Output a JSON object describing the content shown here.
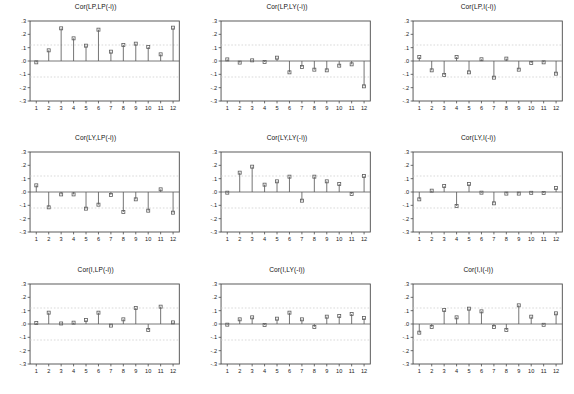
{
  "figure": {
    "name": "cross-correlogram-matrix",
    "rows": 3,
    "cols": 3
  },
  "chart_data": [
    {
      "type": "bar",
      "title": "Cor(LP,LP(-i))",
      "xlabel": "",
      "ylabel": "",
      "categories": [
        1,
        2,
        3,
        4,
        5,
        6,
        7,
        8,
        9,
        10,
        11,
        12
      ],
      "values": [
        -0.01,
        0.08,
        0.245,
        0.17,
        0.115,
        0.235,
        0.07,
        0.12,
        0.13,
        0.105,
        0.05,
        0.25
      ],
      "ylim": [
        -0.3,
        0.3
      ],
      "yticks": [
        ".3",
        ".2",
        ".1",
        ".0",
        "-.1",
        "-.2",
        "-.3"
      ],
      "xticks": [
        "1",
        "2",
        "3",
        "4",
        "5",
        "6",
        "7",
        "8",
        "9",
        "10",
        "11",
        "12"
      ],
      "confidence_band": 0.12,
      "grid": false,
      "legend": "none"
    },
    {
      "type": "bar",
      "title": "Cor(LP,LY(-i))",
      "xlabel": "",
      "ylabel": "",
      "categories": [
        1,
        2,
        3,
        4,
        5,
        6,
        7,
        8,
        9,
        10,
        11,
        12
      ],
      "values": [
        0.012,
        -0.012,
        0.005,
        -0.007,
        0.025,
        -0.085,
        -0.045,
        -0.065,
        -0.07,
        -0.035,
        -0.025,
        -0.19
      ],
      "ylim": [
        -0.3,
        0.3
      ],
      "yticks": [
        ".3",
        ".2",
        ".1",
        ".0",
        "-.1",
        "-.2",
        "-.3"
      ],
      "xticks": [
        "1",
        "2",
        "3",
        "4",
        "5",
        "6",
        "7",
        "8",
        "9",
        "10",
        "11",
        "12"
      ],
      "confidence_band": 0.12,
      "grid": false,
      "legend": "none"
    },
    {
      "type": "bar",
      "title": "Cor(LP,I(-i))",
      "xlabel": "",
      "ylabel": "",
      "categories": [
        1,
        2,
        3,
        4,
        5,
        6,
        7,
        8,
        9,
        10,
        11,
        12
      ],
      "values": [
        0.03,
        -0.07,
        -0.105,
        0.03,
        -0.085,
        0.013,
        -0.125,
        0.018,
        -0.065,
        -0.015,
        -0.01,
        -0.095
      ],
      "ylim": [
        -0.3,
        0.3
      ],
      "yticks": [
        ".3",
        ".2",
        ".1",
        ".0",
        "-.1",
        "-.2",
        "-.3"
      ],
      "xticks": [
        "1",
        "2",
        "3",
        "4",
        "5",
        "6",
        "7",
        "8",
        "9",
        "10",
        "11",
        "12"
      ],
      "confidence_band": 0.12,
      "grid": false,
      "legend": "none"
    },
    {
      "type": "bar",
      "title": "Cor(LY,LP(-i))",
      "xlabel": "",
      "ylabel": "",
      "categories": [
        1,
        2,
        3,
        4,
        5,
        6,
        7,
        8,
        9,
        10,
        11,
        12
      ],
      "values": [
        0.05,
        -0.115,
        -0.018,
        -0.018,
        -0.125,
        -0.095,
        -0.022,
        -0.15,
        -0.055,
        -0.14,
        0.02,
        -0.155
      ],
      "ylim": [
        -0.3,
        0.3
      ],
      "yticks": [
        ".3",
        ".2",
        ".1",
        ".0",
        "-.1",
        "-.2",
        "-.3"
      ],
      "xticks": [
        "1",
        "2",
        "3",
        "4",
        "5",
        "6",
        "7",
        "8",
        "9",
        "10",
        "11",
        "12"
      ],
      "confidence_band": 0.12,
      "grid": false,
      "legend": "none"
    },
    {
      "type": "bar",
      "title": "Cor(LY,LY(-i))",
      "xlabel": "",
      "ylabel": "",
      "categories": [
        1,
        2,
        3,
        4,
        5,
        6,
        7,
        8,
        9,
        10,
        11,
        12
      ],
      "values": [
        -0.005,
        0.145,
        0.19,
        0.055,
        0.08,
        0.115,
        -0.065,
        0.115,
        0.08,
        0.06,
        -0.015,
        0.12
      ],
      "ylim": [
        -0.3,
        0.3
      ],
      "yticks": [
        ".3",
        ".2",
        ".1",
        ".0",
        "-.1",
        "-.2",
        "-.3"
      ],
      "xticks": [
        "1",
        "2",
        "3",
        "4",
        "5",
        "6",
        "7",
        "8",
        "9",
        "10",
        "11",
        "12"
      ],
      "confidence_band": 0.12,
      "grid": false,
      "legend": "none"
    },
    {
      "type": "bar",
      "title": "Cor(LY,I(-i))",
      "xlabel": "",
      "ylabel": "",
      "categories": [
        1,
        2,
        3,
        4,
        5,
        6,
        7,
        8,
        9,
        10,
        11,
        12
      ],
      "values": [
        -0.055,
        0.01,
        0.045,
        -0.105,
        0.06,
        -0.005,
        -0.085,
        -0.012,
        -0.012,
        -0.006,
        -0.008,
        0.03
      ],
      "ylim": [
        -0.3,
        0.3
      ],
      "yticks": [
        ".3",
        ".2",
        ".1",
        ".0",
        "-.1",
        "-.2",
        "-.3"
      ],
      "xticks": [
        "1",
        "2",
        "3",
        "4",
        "5",
        "6",
        "7",
        "8",
        "9",
        "10",
        "11",
        "12"
      ],
      "confidence_band": 0.12,
      "grid": false,
      "legend": "none"
    },
    {
      "type": "bar",
      "title": "Cor(I,LP(-i))",
      "xlabel": "",
      "ylabel": "",
      "categories": [
        1,
        2,
        3,
        4,
        5,
        6,
        7,
        8,
        9,
        10,
        11,
        12
      ],
      "values": [
        0.008,
        0.085,
        0.004,
        0.01,
        0.03,
        0.085,
        -0.012,
        0.035,
        0.12,
        -0.045,
        0.13,
        0.012
      ],
      "ylim": [
        -0.3,
        0.3
      ],
      "yticks": [
        ".3",
        ".2",
        ".1",
        ".0",
        "-.1",
        "-.2",
        "-.3"
      ],
      "xticks": [
        "1",
        "2",
        "3",
        "4",
        "5",
        "6",
        "7",
        "8",
        "9",
        "10",
        "11",
        "12"
      ],
      "confidence_band": 0.12,
      "grid": false,
      "legend": "none"
    },
    {
      "type": "bar",
      "title": "Cor(I,LY(-i))",
      "xlabel": "",
      "ylabel": "",
      "categories": [
        1,
        2,
        3,
        4,
        5,
        6,
        7,
        8,
        9,
        10,
        11,
        12
      ],
      "values": [
        -0.005,
        0.035,
        0.05,
        -0.008,
        0.04,
        0.085,
        0.035,
        -0.022,
        0.055,
        0.06,
        0.075,
        0.045
      ],
      "ylim": [
        -0.3,
        0.3
      ],
      "yticks": [
        ".3",
        ".2",
        ".1",
        ".0",
        "-.1",
        "-.2",
        "-.3"
      ],
      "xticks": [
        "1",
        "2",
        "3",
        "4",
        "5",
        "6",
        "7",
        "8",
        "9",
        "10",
        "11",
        "12"
      ],
      "confidence_band": 0.12,
      "grid": false,
      "legend": "none"
    },
    {
      "type": "bar",
      "title": "Cor(I,I(-i))",
      "xlabel": "",
      "ylabel": "",
      "categories": [
        1,
        2,
        3,
        4,
        5,
        6,
        7,
        8,
        9,
        10,
        11,
        12
      ],
      "values": [
        -0.065,
        -0.022,
        0.105,
        0.05,
        0.115,
        0.095,
        -0.022,
        -0.045,
        0.14,
        0.055,
        -0.006,
        0.08
      ],
      "ylim": [
        -0.3,
        0.3
      ],
      "yticks": [
        ".3",
        ".2",
        ".1",
        ".0",
        "-.1",
        "-.2",
        "-.3"
      ],
      "xticks": [
        "1",
        "2",
        "3",
        "4",
        "5",
        "6",
        "7",
        "8",
        "9",
        "10",
        "11",
        "12"
      ],
      "confidence_band": 0.12,
      "grid": false,
      "legend": "none"
    }
  ]
}
